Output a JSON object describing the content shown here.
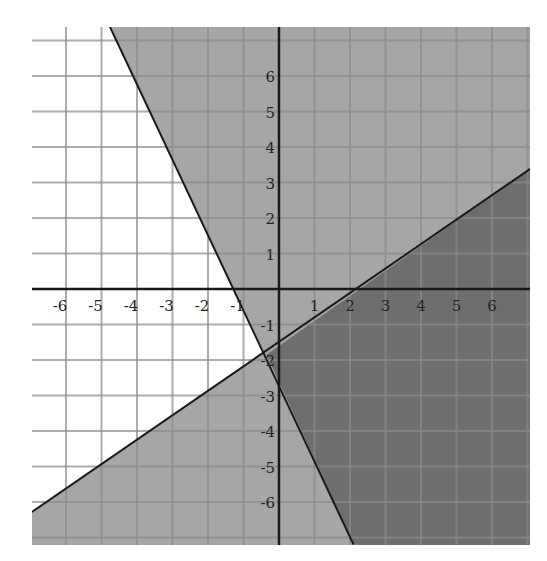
{
  "caption": "",
  "chart_data": {
    "type": "line",
    "title": "",
    "xlabel": "",
    "ylabel": "",
    "xlim": [
      -7,
      7
    ],
    "ylim": [
      -7,
      7.5
    ],
    "grid": true,
    "x_ticks": [
      "-6",
      "-5",
      "-4",
      "-3",
      "-2",
      "-1",
      "1",
      "2",
      "3",
      "4",
      "5",
      "6"
    ],
    "y_ticks": [
      "6",
      "5",
      "4",
      "3",
      "2",
      "1",
      "-1",
      "-2",
      "-3",
      "-4",
      "-5",
      "-6"
    ],
    "series": [
      {
        "name": "line-steep",
        "equation": "y = -2x - 2",
        "points": [
          [
            -4.76,
            7.38
          ],
          [
            -1,
            0
          ],
          [
            0,
            -2.5
          ],
          [
            2.1,
            -7.2
          ]
        ],
        "shading": "right / above"
      },
      {
        "name": "line-shallow",
        "equation": "y ≈ 0.7x - 1.4",
        "points": [
          [
            -6.96,
            -6.28
          ],
          [
            0,
            -1.6
          ],
          [
            2,
            0
          ],
          [
            7.1,
            3.4
          ]
        ],
        "shading": "below"
      }
    ],
    "regions": [
      {
        "name": "shaded by steep line (right side)",
        "color": "#a6a6a6"
      },
      {
        "name": "shaded by shallow line (below)",
        "color": "#a6a6a6"
      },
      {
        "name": "overlap (solution)",
        "color": "#6e6e6e"
      },
      {
        "name": "unshaded",
        "color": "#ffffff"
      }
    ]
  }
}
